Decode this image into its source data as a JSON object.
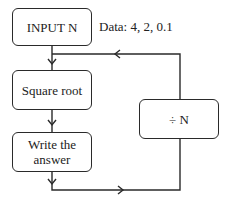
{
  "diagram": {
    "type": "flowchart",
    "nodes": {
      "input": {
        "label": "INPUT N"
      },
      "sqrt": {
        "label": "Square root"
      },
      "write": {
        "label": "Write the answer",
        "line1": "Write the",
        "line2": "answer"
      },
      "divide": {
        "label": "÷ N"
      }
    },
    "annotation": {
      "text": "Data: 4, 2, 0.1"
    },
    "edges": [
      {
        "from": "input",
        "to": "sqrt"
      },
      {
        "from": "sqrt",
        "to": "write"
      },
      {
        "from": "write",
        "to": "divide"
      },
      {
        "from": "divide",
        "to": "sqrt"
      }
    ],
    "colors": {
      "stroke": "#2a2a2a",
      "background": "#ffffff"
    }
  }
}
